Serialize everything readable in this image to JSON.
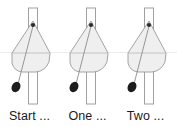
{
  "figure": {
    "background_color": "#ffffff",
    "panel_count": 3,
    "horizontal_rule_color": "#eceaea",
    "panels": [
      {
        "caption": "Start ...",
        "body_fill": "#efefef",
        "body_stroke": "#9a9a9a",
        "pole_fill": "#ffffff",
        "pole_stroke": "#9a9a9a",
        "string_color": "#8c8c8c",
        "bob_color": "#1c1c1c",
        "pivot_color": "#2b2b2b"
      },
      {
        "caption": "One ...",
        "body_fill": "#efefef",
        "body_stroke": "#9a9a9a",
        "pole_fill": "#ffffff",
        "pole_stroke": "#9a9a9a",
        "string_color": "#8c8c8c",
        "bob_color": "#1c1c1c",
        "pivot_color": "#2b2b2b"
      },
      {
        "caption": "Two ...",
        "body_fill": "#efefef",
        "body_stroke": "#9a9a9a",
        "pole_fill": "#ffffff",
        "pole_stroke": "#9a9a9a",
        "string_color": "#8c8c8c",
        "bob_color": "#1c1c1c",
        "pivot_color": "#2b2b2b"
      }
    ]
  }
}
